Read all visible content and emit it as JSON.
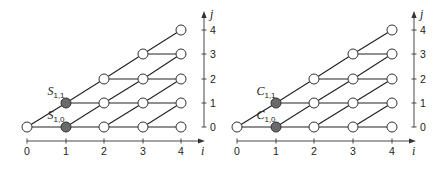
{
  "diagrams": [
    {
      "id": "S",
      "label_symbol": "S",
      "origin_x": 27,
      "i_positions": [
        27,
        66,
        104,
        143,
        181
      ],
      "j_positions": [
        127,
        103,
        79,
        54,
        30
      ],
      "j_axis_x": 204,
      "i_axis_y": 141,
      "i_ticks": [
        "0",
        "1",
        "2",
        "3",
        "4"
      ],
      "j_ticks": [
        "0",
        "1",
        "2",
        "3",
        "4"
      ],
      "i_axis_label": "i",
      "j_axis_label": "j",
      "highlighted_nodes": [
        [
          1,
          0
        ],
        [
          1,
          1
        ]
      ],
      "node_labels": [
        {
          "text": "S",
          "sub": "1,1",
          "i": 1,
          "j": 1
        },
        {
          "text": "S",
          "sub": "1,0",
          "i": 1,
          "j": 0
        }
      ]
    },
    {
      "id": "C",
      "label_symbol": "C",
      "origin_x": 237,
      "i_positions": [
        237,
        276,
        314,
        353,
        392
      ],
      "j_positions": [
        127,
        103,
        79,
        54,
        30
      ],
      "j_axis_x": 414,
      "i_axis_y": 141,
      "i_ticks": [
        "0",
        "1",
        "2",
        "3",
        "4"
      ],
      "j_ticks": [
        "0",
        "1",
        "2",
        "3",
        "4"
      ],
      "i_axis_label": "i",
      "j_axis_label": "j",
      "highlighted_nodes": [
        [
          1,
          0
        ],
        [
          1,
          1
        ]
      ],
      "node_labels": [
        {
          "text": "C",
          "sub": "1,1",
          "i": 1,
          "j": 1
        },
        {
          "text": "C",
          "sub": "1,0",
          "i": 1,
          "j": 0
        }
      ]
    }
  ],
  "lattice": {
    "max_i": 4,
    "rule": "node (i,j) exists for 0 <= j <= i; horizontal edge (i,j)-(i+1,j); diagonal edge (i,j)-(i+1,j+1)",
    "colors": {
      "edge": "#222222",
      "node_fill_open": "#ffffff",
      "node_fill_highlight": "#6a6a6a"
    }
  }
}
